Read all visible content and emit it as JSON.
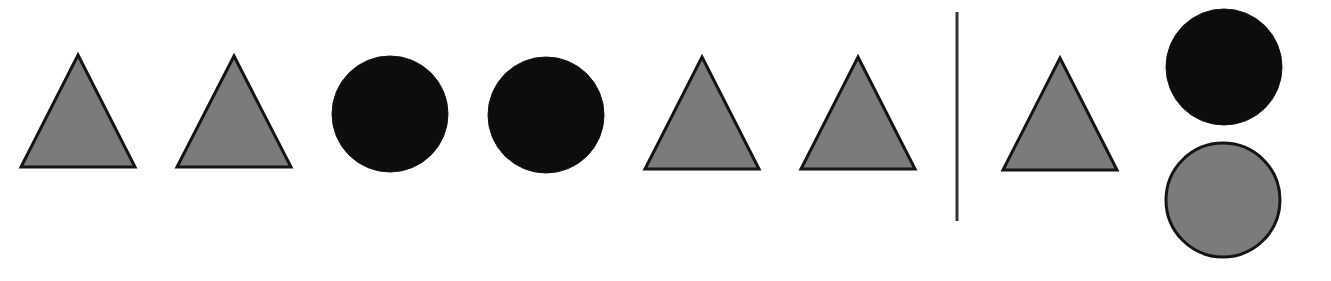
{
  "puzzle": {
    "type": "sequence-pattern-completion",
    "colors": {
      "background": "#ffffff",
      "gray_fill": "#7b7b7b",
      "black_fill": "#0d0d0d",
      "outline": "#141414",
      "divider": "#333333"
    },
    "sequence": [
      {
        "shape": "triangle",
        "fill": "gray",
        "cx": 78,
        "apex_y": 55,
        "base_y": 167,
        "half_width": 57
      },
      {
        "shape": "triangle",
        "fill": "gray",
        "cx": 234,
        "apex_y": 56,
        "base_y": 167,
        "half_width": 57
      },
      {
        "shape": "circle",
        "fill": "black",
        "cx": 390,
        "cy": 114,
        "r": 58
      },
      {
        "shape": "circle",
        "fill": "black",
        "cx": 546,
        "cy": 115,
        "r": 58
      },
      {
        "shape": "triangle",
        "fill": "gray",
        "cx": 702,
        "apex_y": 57,
        "base_y": 169,
        "half_width": 57
      },
      {
        "shape": "triangle",
        "fill": "gray",
        "cx": 858,
        "apex_y": 57,
        "base_y": 169,
        "half_width": 57
      },
      {
        "shape": "triangle",
        "fill": "gray",
        "cx": 1060,
        "apex_y": 58,
        "base_y": 170,
        "half_width": 57
      }
    ],
    "divider": {
      "x": 957,
      "y1": 12,
      "y2": 221
    },
    "options": [
      {
        "shape": "circle",
        "fill": "black",
        "cx": 1224,
        "cy": 67,
        "r": 58
      },
      {
        "shape": "circle",
        "fill": "gray",
        "cx": 1223,
        "cy": 200,
        "r": 57
      }
    ]
  }
}
